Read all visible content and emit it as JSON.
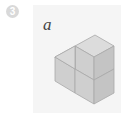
{
  "problem": {
    "number": "3",
    "label": "a"
  },
  "figure": {
    "colors": {
      "top": "#dcdcdc",
      "left": "#cfcfcf",
      "right": "#c4c4c4",
      "edge": "#a8a8a8",
      "panel": "#f5f5f5",
      "badge": "#d9d9d9"
    }
  }
}
